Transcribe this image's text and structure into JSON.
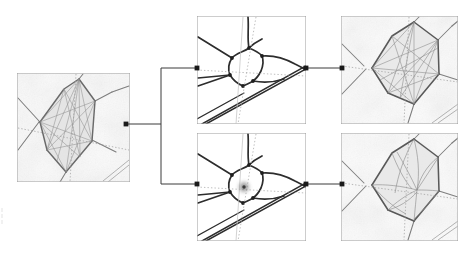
{
  "figure": {
    "title": "",
    "background_color": "#ffffff",
    "width": 471,
    "height": 254,
    "connector_color": "#3a3a3a",
    "node_color": "#1a1a1a",
    "panel_border_color": "#9a9a9a"
  },
  "panels": [
    {
      "id": "source-cell",
      "label": "source-cell-panel",
      "role": "input",
      "x": 17,
      "y": 73,
      "w": 113,
      "h": 109,
      "style": "photographic micrograph with overlaid polygon mesh",
      "content_description": "Grain-boundary micrograph: an elongated hexagonal cell outlined in dark grey, filled with a dense fan of straight chord lines connecting boundary vertices; faint dotted construction lines cross the cell.",
      "visual": {
        "cell_outline": "elongated-hexagon",
        "cell_fill": "#e4e4e4",
        "chord_count": 16,
        "has_dotted_axes": true,
        "has_texture": true,
        "texture_tone": "#f2f2f2"
      }
    },
    {
      "id": "topology-top",
      "label": "topology-top-panel",
      "role": "intermediate",
      "x": 197,
      "y": 16,
      "w": 109,
      "h": 108,
      "style": "clean line drawing of network topology",
      "content_description": "Schematic line graph: thick dark edges form a small quadrilateral cell with junction vertices, a double-stroked diagonal band runs lower-right, dotted axes cross the cell centre.",
      "visual": {
        "cell_outline": "quadrilateral",
        "cell_fill": "#ffffff",
        "chord_count": 0,
        "has_dotted_axes": true,
        "has_texture": false,
        "has_center_marker": false
      }
    },
    {
      "id": "topology-bottom",
      "label": "topology-bottom-panel",
      "role": "intermediate",
      "x": 197,
      "y": 133,
      "w": 109,
      "h": 108,
      "style": "clean line drawing of network topology with highlighted centroid",
      "content_description": "Same schematic line graph as above but with a soft grey blurred disc marking the cell centroid where the dotted axes intersect.",
      "visual": {
        "cell_outline": "quadrilateral",
        "cell_fill": "#ffffff",
        "chord_count": 0,
        "has_dotted_axes": true,
        "has_texture": false,
        "has_center_marker": true,
        "center_marker_color": "#8a8a8a"
      }
    },
    {
      "id": "result-top",
      "label": "result-top-panel",
      "role": "output",
      "x": 341,
      "y": 16,
      "w": 117,
      "h": 108,
      "style": "photographic micrograph with overlaid reconstructed mesh",
      "content_description": "Micrograph with a large hexagonal cell outlined in dark grey; interior filled with straight chords radiating from the upper and lower apexes, dotted axes crossing; faint parallel scratch lines at lower right.",
      "visual": {
        "cell_outline": "elongated-hexagon",
        "cell_fill": "#e6e6e6",
        "chord_count": 14,
        "has_dotted_axes": true,
        "has_texture": true,
        "texture_tone": "#f4f4f4"
      }
    },
    {
      "id": "result-bottom",
      "label": "result-bottom-panel",
      "role": "output",
      "x": 341,
      "y": 133,
      "w": 117,
      "h": 108,
      "style": "photographic micrograph with overlaid reconstructed mesh, curved chords",
      "content_description": "Micrograph with the same hexagonal cell but interior chords are curved arcs converging on an off-centre focus to the right, producing a fan/web appearance; dotted axes cross the cell.",
      "visual": {
        "cell_outline": "elongated-hexagon",
        "cell_fill": "#e6e6e6",
        "chord_count": 13,
        "chord_shape": "curved",
        "has_dotted_axes": true,
        "has_texture": true,
        "texture_tone": "#f4f4f4"
      }
    }
  ],
  "connectors": {
    "description": "Binary fan-out tree: one source node splits to two intermediate panels, each intermediate emits to one result panel.",
    "nodes": [
      {
        "id": "source-out",
        "name": "source-output-node",
        "x": 126,
        "y": 124
      },
      {
        "id": "top-in",
        "name": "topology-top-input-node",
        "x": 197,
        "y": 68
      },
      {
        "id": "bottom-in",
        "name": "topology-bottom-input-node",
        "x": 197,
        "y": 184
      },
      {
        "id": "top-out",
        "name": "topology-top-output-node",
        "x": 306,
        "y": 68
      },
      {
        "id": "bottom-out",
        "name": "topology-bottom-output-node",
        "x": 306,
        "y": 184
      },
      {
        "id": "result-top-in",
        "name": "result-top-input-node",
        "x": 342,
        "y": 68
      },
      {
        "id": "result-bot-in",
        "name": "result-bottom-input-node",
        "x": 342,
        "y": 184
      }
    ],
    "paths": [
      {
        "name": "source-to-split",
        "d": "M126,124 L161,124"
      },
      {
        "name": "split-riser",
        "d": "M161,68 L161,184"
      },
      {
        "name": "split-to-topology-top",
        "d": "M161,68 L197,68"
      },
      {
        "name": "split-to-topology-bottom",
        "d": "M161,184 L197,184"
      },
      {
        "name": "topology-top-to-result",
        "d": "M306,68 L342,68"
      },
      {
        "name": "topology-bottom-to-result",
        "d": "M306,184 L342,184"
      }
    ]
  }
}
